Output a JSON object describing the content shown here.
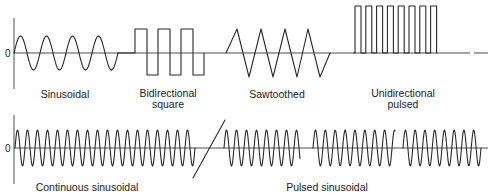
{
  "figure": {
    "zero_label": "0",
    "top_row": {
      "waveforms": [
        {
          "id": "sinusoidal",
          "label_lines": [
            "Sinusoidal"
          ]
        },
        {
          "id": "bidirectional-square",
          "label_lines": [
            "Bidirectional",
            "square"
          ]
        },
        {
          "id": "sawtoothed",
          "label_lines": [
            "Sawtoothed"
          ]
        },
        {
          "id": "unidirectional-pulsed",
          "label_lines": [
            "Unidirectional",
            "pulsed"
          ]
        }
      ]
    },
    "bottom_row": {
      "waveforms": [
        {
          "id": "continuous-sinusoidal",
          "label_lines": [
            "Continuous sinusoidal"
          ]
        },
        {
          "id": "pulsed-sinusoidal",
          "label_lines": [
            "Pulsed sinusoidal"
          ]
        }
      ]
    },
    "colors": {
      "stroke": "#2a2a2a",
      "background": "#ffffff"
    }
  }
}
